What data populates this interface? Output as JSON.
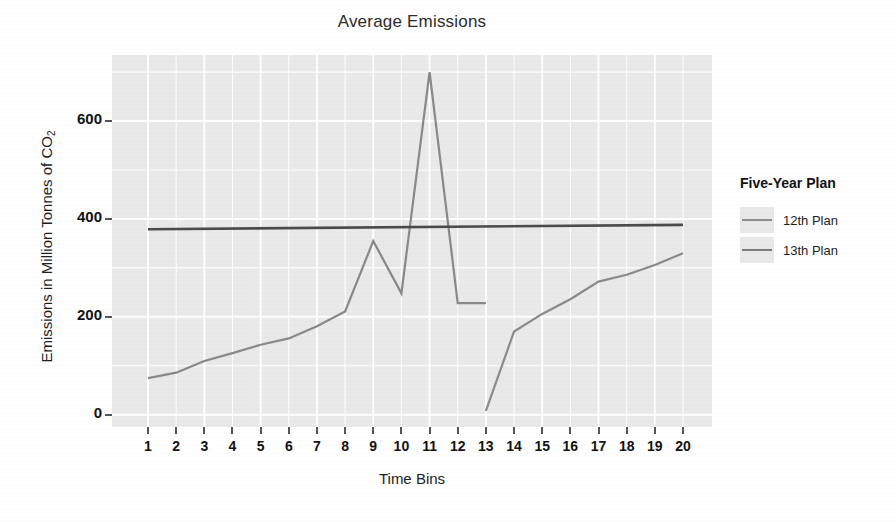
{
  "chart_data": {
    "type": "line",
    "title": "Average Emissions",
    "xlabel": "Time Bins",
    "ylabel": "Emissions in Million Tonnes of CO",
    "ylabel_sub": "2",
    "x": [
      1,
      2,
      3,
      4,
      5,
      6,
      7,
      8,
      9,
      10,
      11,
      12,
      13,
      14,
      15,
      16,
      17,
      18,
      19,
      20
    ],
    "xticklabels": [
      "1",
      "2",
      "3",
      "4",
      "5",
      "6",
      "7",
      "8",
      "9",
      "10",
      "11",
      "12",
      "13",
      "14",
      "15",
      "16",
      "17",
      "18",
      "19",
      "20"
    ],
    "yticks": [
      0,
      200,
      400,
      600
    ],
    "yticklabels": [
      "0",
      "200",
      "400",
      "600"
    ],
    "xlim": [
      1,
      20
    ],
    "ylim": [
      -25,
      735
    ],
    "grid": true,
    "grid_color": "#ffffff",
    "panel_color": "#e9e9e9",
    "legend_position": "right",
    "series": [
      {
        "name": "12th Plan",
        "color": "#888888",
        "x": [
          1,
          2,
          3,
          4,
          5,
          6,
          7,
          8,
          9,
          10,
          11,
          12,
          13
        ],
        "values": [
          75,
          86,
          110,
          126,
          143,
          156,
          181,
          211,
          355,
          248,
          700,
          228,
          228
        ]
      },
      {
        "name": "13th Plan",
        "color": "#8a8a8a",
        "x": [
          13,
          14,
          15,
          16,
          17,
          18,
          19,
          20
        ],
        "values": [
          8,
          170,
          206,
          236,
          272,
          286,
          306,
          330
        ]
      },
      {
        "name": "trend-line",
        "color": "#4a4a4a",
        "x": [
          1,
          20
        ],
        "values": [
          379,
          388
        ]
      }
    ]
  },
  "legend": {
    "title": "Five-Year Plan",
    "items": [
      {
        "label": "12th Plan",
        "color": "#8e8e8e"
      },
      {
        "label": "13th Plan",
        "color": "#7a7a7a"
      }
    ]
  }
}
